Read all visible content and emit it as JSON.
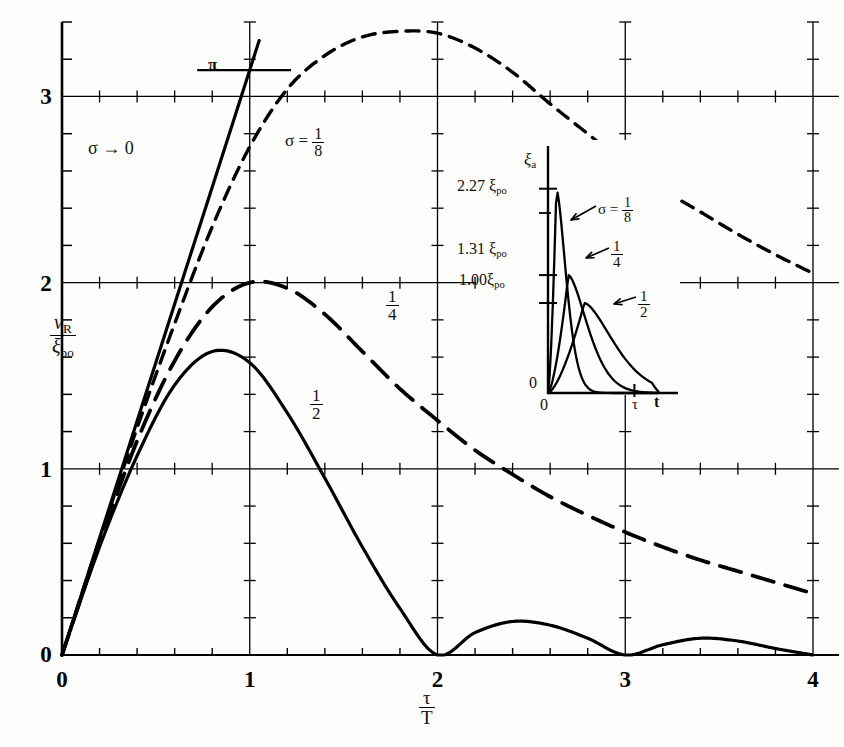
{
  "figure": {
    "background": "#fdfdfb",
    "ink": "#000000"
  },
  "axes": {
    "xlabel_num": "τ",
    "xlabel_den": "T",
    "ylabel_num_var": "ν",
    "ylabel_num_sub": "R",
    "ylabel_den_var": "ξ",
    "ylabel_den_sub": "po",
    "x_ticks": [
      "0",
      "1",
      "2",
      "3",
      "4"
    ],
    "y_ticks": [
      "0",
      "1",
      "2",
      "3"
    ],
    "pi_label": "π",
    "pi_value": 3.1416
  },
  "annotations": {
    "sigma_zero": "σ → 0",
    "sigma_eighth_prefix": "σ =",
    "sigma_eighth_num": "1",
    "sigma_eighth_den": "8",
    "quarter_num": "1",
    "quarter_den": "4",
    "half_num": "1",
    "half_den": "2"
  },
  "inset": {
    "ylabel_var": "ξ",
    "ylabel_sub": "a",
    "xlabel_tau": "τ",
    "xlabel_t": "t",
    "origin_y": "0",
    "origin_x": "0",
    "ytick_labels": [
      "2.27 ξ",
      "1.31 ξ",
      "1.00ξ"
    ],
    "ytick_sub": "po",
    "ytick_values": [
      2.27,
      1.31,
      1.0
    ],
    "curve_labels": {
      "eighth_prefix": "σ =",
      "eighth_num": "1",
      "eighth_den": "8",
      "quarter_num": "1",
      "quarter_den": "4",
      "half_num": "1",
      "half_den": "2"
    }
  },
  "chart_data": {
    "type": "line",
    "title": "",
    "xlabel": "τ/T",
    "ylabel": "ν_R/ξ_po",
    "xlim": [
      0,
      4
    ],
    "ylim": [
      0,
      3.4
    ],
    "grid": "major gridlines at y=1,2,3 and x=1,2,3,4 with minor ticks",
    "legend_position": "inline-annotations",
    "series": [
      {
        "name": "σ → 0",
        "style": "solid-straight",
        "description": "straight line of slope π through origin, terminates just above π",
        "x": [
          0,
          0.2,
          0.4,
          0.6,
          0.8,
          1.0,
          1.05
        ],
        "y": [
          0,
          0.628,
          1.257,
          1.885,
          2.513,
          3.142,
          3.3
        ]
      },
      {
        "name": "σ = 1/8",
        "style": "short-dashed",
        "x": [
          0,
          0.2,
          0.4,
          0.6,
          0.8,
          1.0,
          1.2,
          1.4,
          1.6,
          1.8,
          2.0,
          2.2,
          2.4,
          2.6,
          2.8,
          3.0,
          3.2,
          3.4,
          3.6,
          3.8,
          4.0
        ],
        "y": [
          0,
          0.62,
          1.22,
          1.78,
          2.3,
          2.73,
          3.04,
          3.22,
          3.32,
          3.35,
          3.34,
          3.26,
          3.13,
          2.96,
          2.8,
          2.64,
          2.5,
          2.38,
          2.26,
          2.15,
          2.05
        ]
      },
      {
        "name": "1/4",
        "style": "long-dashed",
        "x": [
          0,
          0.2,
          0.4,
          0.6,
          0.8,
          1.0,
          1.2,
          1.4,
          1.6,
          1.8,
          2.0,
          2.2,
          2.4,
          2.6,
          2.8,
          3.0,
          3.2,
          3.4,
          3.6,
          3.8,
          4.0
        ],
        "y": [
          0,
          0.6,
          1.15,
          1.58,
          1.87,
          2.0,
          1.97,
          1.83,
          1.63,
          1.43,
          1.26,
          1.1,
          0.97,
          0.85,
          0.75,
          0.66,
          0.58,
          0.51,
          0.45,
          0.39,
          0.33
        ]
      },
      {
        "name": "1/2",
        "style": "solid",
        "x": [
          0,
          0.2,
          0.4,
          0.6,
          0.8,
          1.0,
          1.2,
          1.4,
          1.6,
          1.8,
          2.0,
          2.2,
          2.4,
          2.6,
          2.8,
          3.0,
          3.2,
          3.4,
          3.6,
          3.8,
          4.0
        ],
        "y": [
          0,
          0.58,
          1.07,
          1.45,
          1.63,
          1.57,
          1.3,
          0.95,
          0.58,
          0.25,
          0.0,
          0.12,
          0.18,
          0.16,
          0.09,
          0.0,
          0.055,
          0.09,
          0.075,
          0.035,
          0.0
        ]
      }
    ],
    "inset": {
      "type": "line",
      "xlabel": "t",
      "ylabel": "ξ_a",
      "xlim": [
        0,
        1.35
      ],
      "ylim": [
        0,
        2.5
      ],
      "marked_x": "τ",
      "series": [
        {
          "name": "σ = 1/8",
          "peak": 2.27,
          "peak_x": 0.1
        },
        {
          "name": "1/4",
          "peak": 1.31,
          "peak_x": 0.25
        },
        {
          "name": "1/2",
          "peak": 1.0,
          "peak_x": 0.45
        }
      ]
    }
  }
}
